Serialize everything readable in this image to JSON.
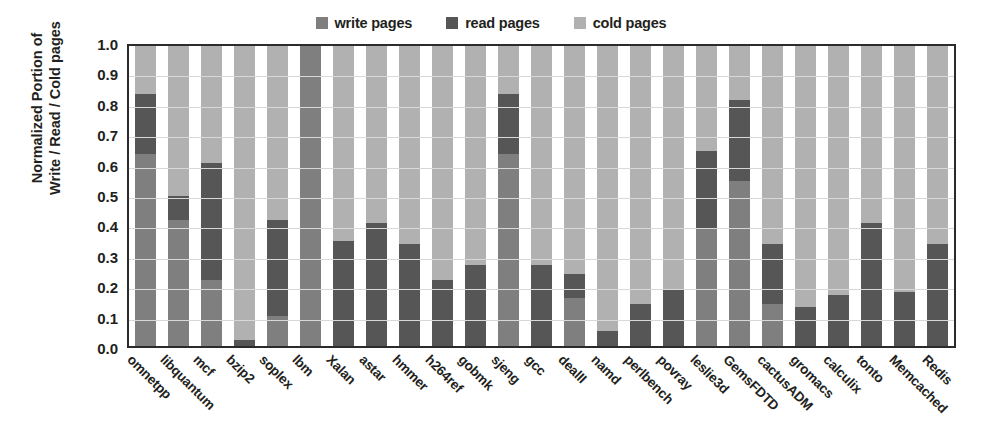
{
  "legend": {
    "position": "top-center",
    "entries": [
      {
        "label": "write pages",
        "color": "#7f7f7f",
        "icon": "square-swatch-icon"
      },
      {
        "label": "read pages",
        "color": "#565656",
        "icon": "square-swatch-icon"
      },
      {
        "label": "cold pages",
        "color": "#b1b1b1",
        "icon": "square-swatch-icon"
      }
    ]
  },
  "axis": {
    "ylabel_line1": "Normalized Portion of",
    "ylabel_line2": "Write / Read / Cold pages",
    "xlabel": "",
    "yticks": [
      "0.0",
      "0.1",
      "0.2",
      "0.3",
      "0.4",
      "0.5",
      "0.6",
      "0.7",
      "0.8",
      "0.9",
      "1.0"
    ]
  },
  "chart_data": {
    "type": "bar",
    "subtype": "stacked-bar-normalized",
    "title": "",
    "xlabel": "",
    "ylabel": "Normalized Portion of Write / Read / Cold pages",
    "ylim": [
      0.0,
      1.0
    ],
    "ytick_values": [
      0.0,
      0.1,
      0.2,
      0.3,
      0.4,
      0.5,
      0.6,
      0.7,
      0.8,
      0.9,
      1.0
    ],
    "grid": true,
    "grid_axis": "y",
    "legend_position": "top-center",
    "stack_order": [
      "write pages",
      "read pages",
      "cold pages"
    ],
    "categories": [
      "omnetpp",
      "libquantum",
      "mcf",
      "bzip2",
      "soplex",
      "lbm",
      "Xalan",
      "astar",
      "hmmer",
      "h264ref",
      "gobmk",
      "sjeng",
      "gcc",
      "dealII",
      "namd",
      "perlbench",
      "povray",
      "leslie3d",
      "GemsFDTD",
      "cactusADM",
      "gromacs",
      "calculix",
      "tonto",
      "Memcached",
      "Redis"
    ],
    "series": [
      {
        "name": "write pages",
        "color": "#7f7f7f",
        "values": [
          0.64,
          0.42,
          0.22,
          0.0,
          0.1,
          1.0,
          0.0,
          0.0,
          0.0,
          0.0,
          0.0,
          0.64,
          0.0,
          0.16,
          0.0,
          0.0,
          0.0,
          0.39,
          0.55,
          0.14,
          0.0,
          0.0,
          0.0,
          0.0,
          0.0
        ]
      },
      {
        "name": "read pages",
        "color": "#565656",
        "values": [
          0.2,
          0.08,
          0.39,
          0.02,
          0.32,
          0.0,
          0.35,
          0.41,
          0.34,
          0.22,
          0.27,
          0.2,
          0.27,
          0.08,
          0.05,
          0.14,
          0.19,
          0.26,
          0.27,
          0.2,
          0.13,
          0.17,
          0.41,
          0.18,
          0.34
        ]
      },
      {
        "name": "cold pages",
        "color": "#b1b1b1",
        "values": [
          0.16,
          0.5,
          0.39,
          0.98,
          0.58,
          0.0,
          0.65,
          0.59,
          0.66,
          0.78,
          0.73,
          0.16,
          0.73,
          0.76,
          0.95,
          0.86,
          0.81,
          0.35,
          0.18,
          0.66,
          0.87,
          0.83,
          0.59,
          0.82,
          0.66
        ]
      }
    ],
    "stack_tops": {
      "write_top": [
        0.64,
        0.42,
        0.22,
        0.0,
        0.1,
        1.0,
        0.0,
        0.0,
        0.0,
        0.0,
        0.0,
        0.64,
        0.0,
        0.16,
        0.0,
        0.0,
        0.0,
        0.39,
        0.55,
        0.14,
        0.0,
        0.0,
        0.0,
        0.0,
        0.0
      ],
      "read_top": [
        0.84,
        0.5,
        0.61,
        0.02,
        0.42,
        1.0,
        0.35,
        0.41,
        0.34,
        0.22,
        0.27,
        0.84,
        0.27,
        0.24,
        0.05,
        0.14,
        0.19,
        0.65,
        0.82,
        0.34,
        0.13,
        0.17,
        0.41,
        0.18,
        0.34
      ]
    }
  }
}
